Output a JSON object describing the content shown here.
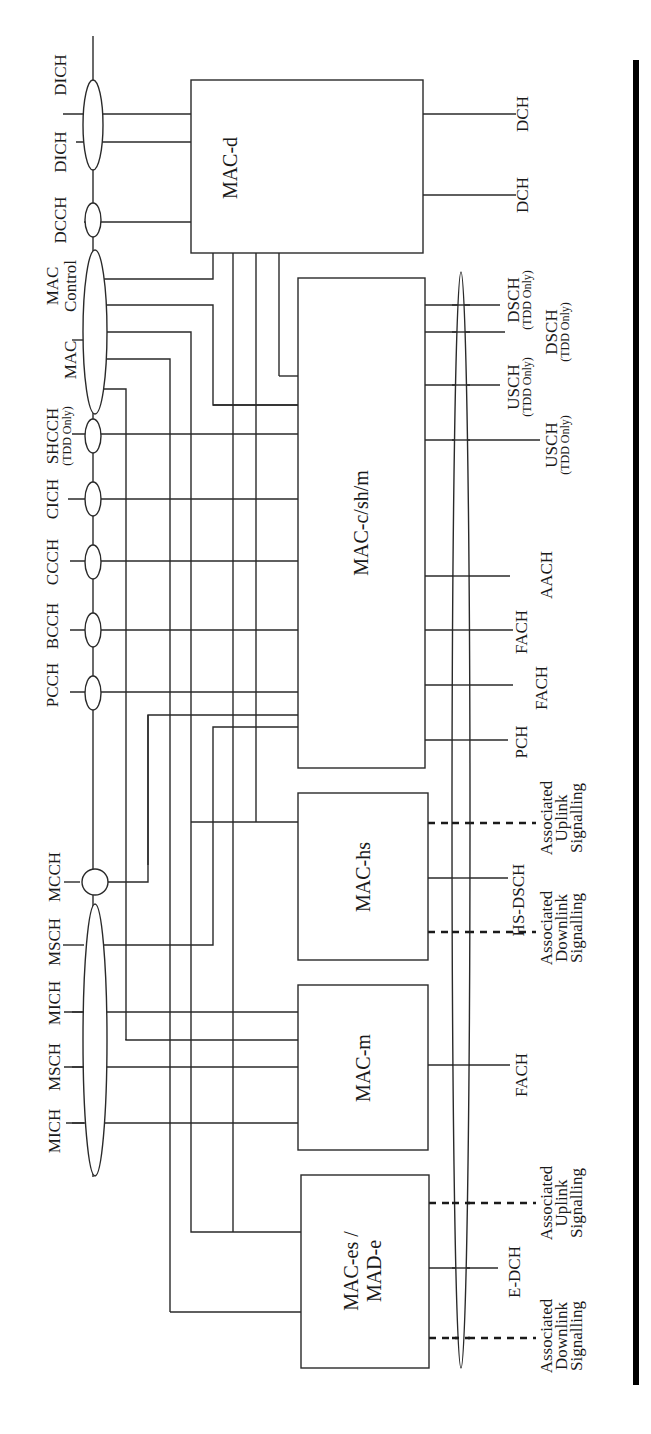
{
  "diagram": {
    "logical_channels": [
      {
        "id": "dich1",
        "label": "DICH"
      },
      {
        "id": "dich2",
        "label": "DICH"
      },
      {
        "id": "dcch",
        "label": "DCCH"
      },
      {
        "id": "mac_control_a",
        "label": "MAC",
        "sub": "Control"
      },
      {
        "id": "mac_control_b",
        "label": "MAC"
      },
      {
        "id": "shcch",
        "label": "SHCCH",
        "sub": "(TDD Only)"
      },
      {
        "id": "cich",
        "label": "CICH"
      },
      {
        "id": "ccch",
        "label": "CCCH"
      },
      {
        "id": "bcch",
        "label": "BCCH"
      },
      {
        "id": "pcch",
        "label": "PCCH"
      },
      {
        "id": "mcch",
        "label": "MCCH"
      },
      {
        "id": "msch1",
        "label": "MSCH"
      },
      {
        "id": "mich1",
        "label": "MICH"
      },
      {
        "id": "msch2",
        "label": "MSCH"
      },
      {
        "id": "mich2",
        "label": "MICH"
      }
    ],
    "blocks": [
      {
        "id": "mac_d",
        "label": "MAC-d"
      },
      {
        "id": "mac_c",
        "label": "MAC-c/sh/m"
      },
      {
        "id": "mac_hs",
        "label": "MAC-hs"
      },
      {
        "id": "mac_m",
        "label": "MAC-m"
      },
      {
        "id": "mac_es",
        "label": "MAC-es /",
        "label2": "MAD-e"
      }
    ],
    "transport_channels": [
      {
        "id": "dch1",
        "label": "DCH"
      },
      {
        "id": "dch2",
        "label": "DCH"
      },
      {
        "id": "dsch1",
        "label": "DSCH",
        "sub": "(TDD Only)"
      },
      {
        "id": "dsch2",
        "label": "DSCH",
        "sub": "(TDD Only)"
      },
      {
        "id": "usch1",
        "label": "USCH",
        "sub": "(TDD Only)"
      },
      {
        "id": "usch2",
        "label": "USCH",
        "sub": "(TDD Only)"
      },
      {
        "id": "aach",
        "label": "AACH"
      },
      {
        "id": "fach1",
        "label": "FACH"
      },
      {
        "id": "fach2",
        "label": "FACH"
      },
      {
        "id": "pch",
        "label": "PCH"
      },
      {
        "id": "hs_ul",
        "label": "Associated",
        "l2": "Uplink",
        "l3": "Signalling"
      },
      {
        "id": "hs_dsch",
        "label": "HS-DSCH"
      },
      {
        "id": "hs_dl",
        "label": "Associated",
        "l2": "Downlink",
        "l3": "Signalling"
      },
      {
        "id": "fach3",
        "label": "FACH"
      },
      {
        "id": "e_ul",
        "label": "Associated",
        "l2": "Uplink",
        "l3": "Signalling"
      },
      {
        "id": "e_dch",
        "label": "E-DCH"
      },
      {
        "id": "e_dl",
        "label": "Associated",
        "l2": "Downlink",
        "l3": "Signalling"
      }
    ]
  }
}
